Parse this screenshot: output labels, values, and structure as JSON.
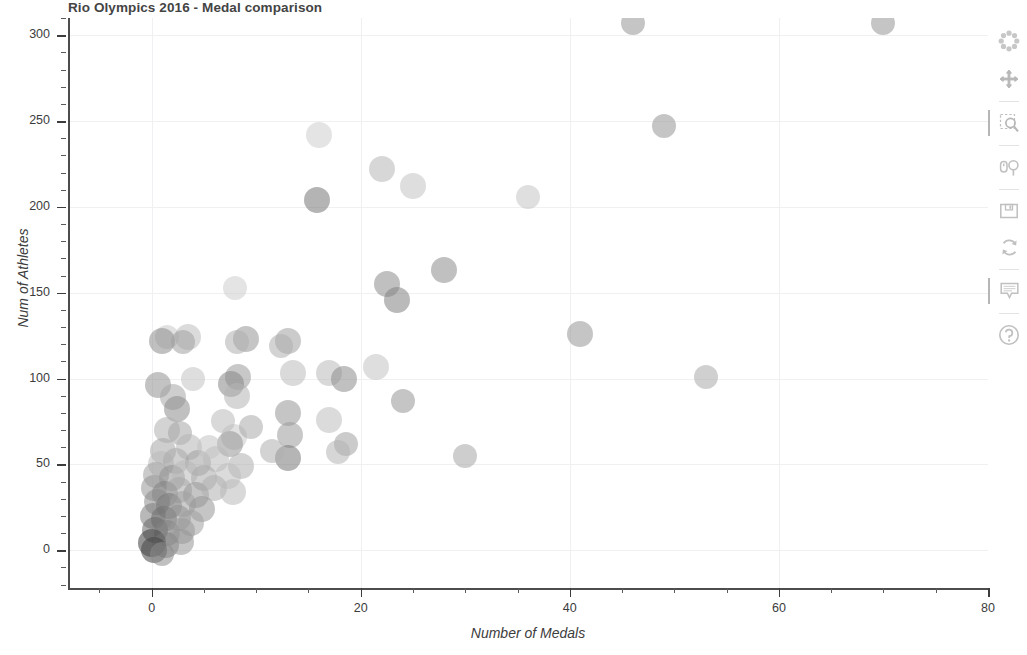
{
  "chart_data": {
    "type": "scatter",
    "title": "Rio Olympics 2016 - Medal comparison",
    "xlabel": "Number of Medals",
    "ylabel": "Num of Athletes",
    "xlim": [
      -8,
      80
    ],
    "ylim": [
      -22,
      310
    ],
    "xticks": [
      0,
      20,
      40,
      60,
      80
    ],
    "yticks": [
      0,
      50,
      100,
      150,
      200,
      250,
      300
    ],
    "x_minor_step": 5,
    "y_minor_step": 10,
    "grid": true,
    "legend": "none",
    "marker": "circle",
    "marker_alpha": 0.55,
    "points": [
      {
        "x": 70,
        "y": 307,
        "r": 12,
        "g": 150
      },
      {
        "x": 46,
        "y": 307,
        "r": 12,
        "g": 150
      },
      {
        "x": 49,
        "y": 247,
        "r": 12,
        "g": 150
      },
      {
        "x": 16,
        "y": 242,
        "r": 13,
        "g": 205
      },
      {
        "x": 22,
        "y": 222,
        "r": 13,
        "g": 182
      },
      {
        "x": 25,
        "y": 212,
        "r": 13,
        "g": 195
      },
      {
        "x": 36,
        "y": 206,
        "r": 12,
        "g": 196
      },
      {
        "x": 15.8,
        "y": 204,
        "r": 13,
        "g": 118
      },
      {
        "x": 28,
        "y": 163,
        "r": 13,
        "g": 140
      },
      {
        "x": 22.5,
        "y": 155,
        "r": 13,
        "g": 140
      },
      {
        "x": 8,
        "y": 153,
        "r": 12,
        "g": 205
      },
      {
        "x": 23.5,
        "y": 146,
        "r": 13,
        "g": 130
      },
      {
        "x": 41,
        "y": 126,
        "r": 13,
        "g": 150
      },
      {
        "x": 1.5,
        "y": 124,
        "r": 12,
        "g": 200
      },
      {
        "x": 1.0,
        "y": 122,
        "r": 13,
        "g": 140
      },
      {
        "x": 3.5,
        "y": 124,
        "r": 13,
        "g": 190
      },
      {
        "x": 3.0,
        "y": 121,
        "r": 12,
        "g": 160
      },
      {
        "x": 9,
        "y": 123,
        "r": 13,
        "g": 150
      },
      {
        "x": 8.2,
        "y": 121,
        "r": 12,
        "g": 175
      },
      {
        "x": 13,
        "y": 122,
        "r": 13,
        "g": 160
      },
      {
        "x": 12.4,
        "y": 119,
        "r": 12,
        "g": 175
      },
      {
        "x": 21.5,
        "y": 107,
        "r": 13,
        "g": 195
      },
      {
        "x": 53,
        "y": 101,
        "r": 12,
        "g": 170
      },
      {
        "x": 17,
        "y": 103,
        "r": 13,
        "g": 185
      },
      {
        "x": 18.4,
        "y": 100,
        "r": 13,
        "g": 140
      },
      {
        "x": 13.5,
        "y": 103,
        "r": 13,
        "g": 188
      },
      {
        "x": 8.3,
        "y": 101,
        "r": 13,
        "g": 155
      },
      {
        "x": 7.6,
        "y": 97,
        "r": 13,
        "g": 135
      },
      {
        "x": 0.6,
        "y": 96,
        "r": 13,
        "g": 145
      },
      {
        "x": 24,
        "y": 87,
        "r": 12,
        "g": 150
      },
      {
        "x": 2.0,
        "y": 89,
        "r": 13,
        "g": 165
      },
      {
        "x": 8.2,
        "y": 90,
        "r": 13,
        "g": 180
      },
      {
        "x": 2.4,
        "y": 82,
        "r": 13,
        "g": 140
      },
      {
        "x": 13,
        "y": 80,
        "r": 13,
        "g": 150
      },
      {
        "x": 17,
        "y": 76,
        "r": 13,
        "g": 190
      },
      {
        "x": 1.5,
        "y": 70,
        "r": 13,
        "g": 175
      },
      {
        "x": 2.7,
        "y": 68,
        "r": 12,
        "g": 165
      },
      {
        "x": 7.9,
        "y": 66,
        "r": 13,
        "g": 200
      },
      {
        "x": 18.6,
        "y": 62,
        "r": 12,
        "g": 160
      },
      {
        "x": 17.8,
        "y": 57,
        "r": 12,
        "g": 180
      },
      {
        "x": 7.5,
        "y": 62,
        "r": 13,
        "g": 150
      },
      {
        "x": 3.6,
        "y": 60,
        "r": 13,
        "g": 180
      },
      {
        "x": 1.1,
        "y": 58,
        "r": 13,
        "g": 165
      },
      {
        "x": 13.2,
        "y": 67,
        "r": 13,
        "g": 155
      },
      {
        "x": 13.0,
        "y": 54,
        "r": 13,
        "g": 120
      },
      {
        "x": 30,
        "y": 55,
        "r": 12,
        "g": 165
      },
      {
        "x": 0.9,
        "y": 50,
        "r": 13,
        "g": 185
      },
      {
        "x": 2.3,
        "y": 52,
        "r": 13,
        "g": 170
      },
      {
        "x": 4.4,
        "y": 51,
        "r": 13,
        "g": 160
      },
      {
        "x": 6.2,
        "y": 53,
        "r": 13,
        "g": 185
      },
      {
        "x": 8.5,
        "y": 49,
        "r": 13,
        "g": 175
      },
      {
        "x": 0.4,
        "y": 44,
        "r": 13,
        "g": 160
      },
      {
        "x": 1.9,
        "y": 42,
        "r": 13,
        "g": 145
      },
      {
        "x": 3.2,
        "y": 45,
        "r": 13,
        "g": 185
      },
      {
        "x": 5.0,
        "y": 42,
        "r": 13,
        "g": 170
      },
      {
        "x": 7.3,
        "y": 43,
        "r": 13,
        "g": 190
      },
      {
        "x": 0.2,
        "y": 36,
        "r": 13,
        "g": 150
      },
      {
        "x": 1.3,
        "y": 33,
        "r": 13,
        "g": 130
      },
      {
        "x": 2.6,
        "y": 35,
        "r": 13,
        "g": 165
      },
      {
        "x": 4.2,
        "y": 32,
        "r": 13,
        "g": 150
      },
      {
        "x": 6.0,
        "y": 36,
        "r": 13,
        "g": 175
      },
      {
        "x": 7.8,
        "y": 34,
        "r": 13,
        "g": 185
      },
      {
        "x": 0.5,
        "y": 28,
        "r": 13,
        "g": 140
      },
      {
        "x": 1.7,
        "y": 26,
        "r": 13,
        "g": 120
      },
      {
        "x": 3.0,
        "y": 27,
        "r": 13,
        "g": 160
      },
      {
        "x": 4.8,
        "y": 24,
        "r": 13,
        "g": 150
      },
      {
        "x": 0.1,
        "y": 20,
        "r": 13,
        "g": 125
      },
      {
        "x": 1.2,
        "y": 18,
        "r": 13,
        "g": 110
      },
      {
        "x": 2.5,
        "y": 19,
        "r": 13,
        "g": 145
      },
      {
        "x": 3.8,
        "y": 16,
        "r": 13,
        "g": 160
      },
      {
        "x": 0.3,
        "y": 12,
        "r": 13,
        "g": 105
      },
      {
        "x": 1.5,
        "y": 10,
        "r": 13,
        "g": 130
      },
      {
        "x": 2.9,
        "y": 11,
        "r": 13,
        "g": 155
      },
      {
        "x": 0.0,
        "y": 4,
        "r": 14,
        "g": 60
      },
      {
        "x": 1.4,
        "y": 3,
        "r": 13,
        "g": 120
      },
      {
        "x": 2.8,
        "y": 5,
        "r": 13,
        "g": 150
      },
      {
        "x": 0.2,
        "y": 0,
        "r": 13,
        "g": 70
      },
      {
        "x": 1.0,
        "y": -2,
        "r": 12,
        "g": 140
      },
      {
        "x": 5.5,
        "y": 60,
        "r": 12,
        "g": 195
      },
      {
        "x": 6.8,
        "y": 75,
        "r": 12,
        "g": 185
      },
      {
        "x": 9.5,
        "y": 72,
        "r": 12,
        "g": 170
      },
      {
        "x": 4.0,
        "y": 100,
        "r": 12,
        "g": 195
      },
      {
        "x": 11.5,
        "y": 58,
        "r": 12,
        "g": 175
      }
    ]
  },
  "toolbar": {
    "tools": [
      {
        "name": "bokeh-logo-icon",
        "label": "Bokeh"
      },
      {
        "name": "pan-tool-icon",
        "label": "Pan"
      },
      {
        "name": "box-zoom-tool-icon",
        "label": "Box Zoom"
      },
      {
        "name": "wheel-zoom-tool-icon",
        "label": "Wheel Zoom"
      },
      {
        "name": "save-tool-icon",
        "label": "Save"
      },
      {
        "name": "reset-tool-icon",
        "label": "Reset"
      },
      {
        "name": "hover-tool-icon",
        "label": "Hover"
      },
      {
        "name": "help-tool-icon",
        "label": "Help"
      }
    ]
  },
  "colors": {
    "background": "#ffffff",
    "gridline": "#f0f0f2",
    "axis": "#4d4d4d",
    "text": "#3c3c3c",
    "title": "#444444"
  }
}
